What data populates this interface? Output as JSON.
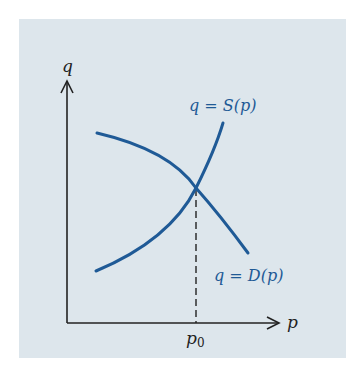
{
  "diagram": {
    "type": "supply-demand",
    "axes": {
      "y_label": "q",
      "x_label": "p"
    },
    "curves": [
      {
        "name": "supply",
        "label": "q = S(p)",
        "shape": "increasing, convex"
      },
      {
        "name": "demand",
        "label": "q = D(p)",
        "shape": "decreasing, concave"
      }
    ],
    "equilibrium": {
      "x_label_base": "p",
      "x_label_sub": "0",
      "marker": "dashed vertical line"
    },
    "colors": {
      "background": "#dde6ec",
      "curve": "#1f5a96",
      "axis": "#222222"
    }
  }
}
